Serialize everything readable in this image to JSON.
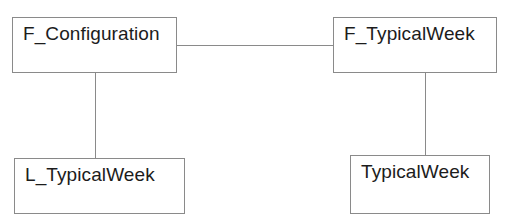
{
  "diagram": {
    "type": "class-diagram",
    "background_color": "#ffffff",
    "border_color": "#8a8a8a",
    "text_color": "#1c1c1c",
    "nodes": [
      {
        "id": "f-configuration",
        "label": "F_Configuration",
        "x": 12,
        "y": 17,
        "width": 165,
        "height": 56
      },
      {
        "id": "f-typicalweek",
        "label": "F_TypicalWeek",
        "x": 333,
        "y": 17,
        "width": 164,
        "height": 56
      },
      {
        "id": "l-typicalweek",
        "label": "L_TypicalWeek",
        "x": 14,
        "y": 158,
        "width": 171,
        "height": 56
      },
      {
        "id": "typicalweek",
        "label": "TypicalWeek",
        "x": 350,
        "y": 155,
        "width": 140,
        "height": 59
      }
    ],
    "edges": [
      {
        "id": "edge-configuration-typicalweek",
        "from": "f-configuration",
        "to": "f-typicalweek",
        "orientation": "horizontal"
      },
      {
        "id": "edge-configuration-ltypicalweek",
        "from": "f-configuration",
        "to": "l-typicalweek",
        "orientation": "vertical"
      },
      {
        "id": "edge-ftypicalweek-typicalweek",
        "from": "f-typicalweek",
        "to": "typicalweek",
        "orientation": "vertical"
      }
    ]
  }
}
